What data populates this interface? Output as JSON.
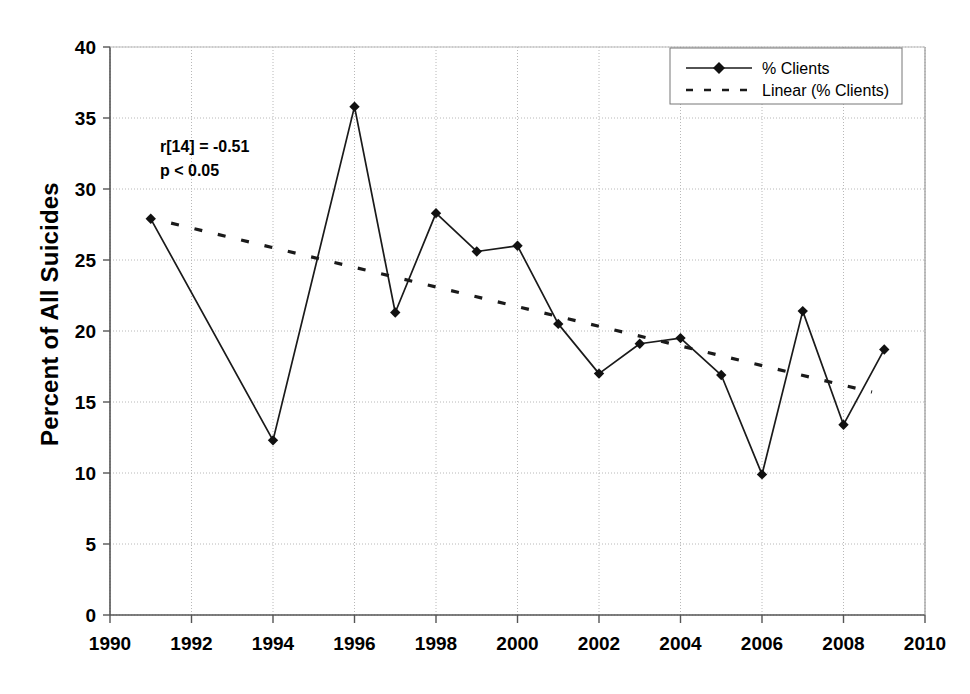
{
  "chart_data": {
    "type": "line",
    "title": "",
    "subtitle": "",
    "xlabel": "",
    "ylabel": "Percent of All Suicides",
    "xlim": [
      1990,
      2010
    ],
    "ylim": [
      0,
      40
    ],
    "ytick_step": 5,
    "xtick_step": 2,
    "grid": true,
    "legend_position": "top-right",
    "x": [
      1991,
      1994,
      1996,
      1997,
      1998,
      1999,
      2000,
      2001,
      2002,
      2003,
      2004,
      2005,
      2006,
      2007,
      2008,
      2009
    ],
    "series": [
      {
        "name": "% Clients",
        "style": "solid-with-diamond-markers",
        "values": [
          27.9,
          12.3,
          35.8,
          21.3,
          28.3,
          25.6,
          26.0,
          20.5,
          17.0,
          19.1,
          19.5,
          16.9,
          9.9,
          21.4,
          13.4,
          18.7
        ]
      },
      {
        "name": "Linear (% Clients)",
        "style": "dashed-trendline",
        "x_endpoints": [
          1991.5,
          2008.7
        ],
        "y_endpoints": [
          27.6,
          15.7
        ]
      }
    ],
    "xticks": [
      "1990",
      "1992",
      "1994",
      "1996",
      "1998",
      "2000",
      "2002",
      "2004",
      "2006",
      "2008",
      "2010"
    ],
    "yticks": [
      "0",
      "5",
      "10",
      "15",
      "20",
      "25",
      "30",
      "35",
      "40"
    ],
    "annotations": [
      {
        "line1": "r[14] = -0.51",
        "line2": "p < 0.05"
      }
    ]
  },
  "axes": {
    "y_axis_title": "Percent of All Suicides",
    "x_axis_title": ""
  },
  "legend": {
    "entries": [
      {
        "label": "% Clients",
        "marker": "diamond-line-marker"
      },
      {
        "label": "Linear (% Clients)",
        "marker": "dashed-line-marker"
      }
    ]
  },
  "stats_box": {
    "correlation": "r[14] = -0.51",
    "pvalue": "p < 0.05"
  },
  "colors": {
    "series_line": "#1a1a1a",
    "trend_line": "#1a1a1a",
    "grid": "#b8b8b8",
    "axis": "#555555",
    "text": "#000000",
    "background": "#ffffff"
  }
}
